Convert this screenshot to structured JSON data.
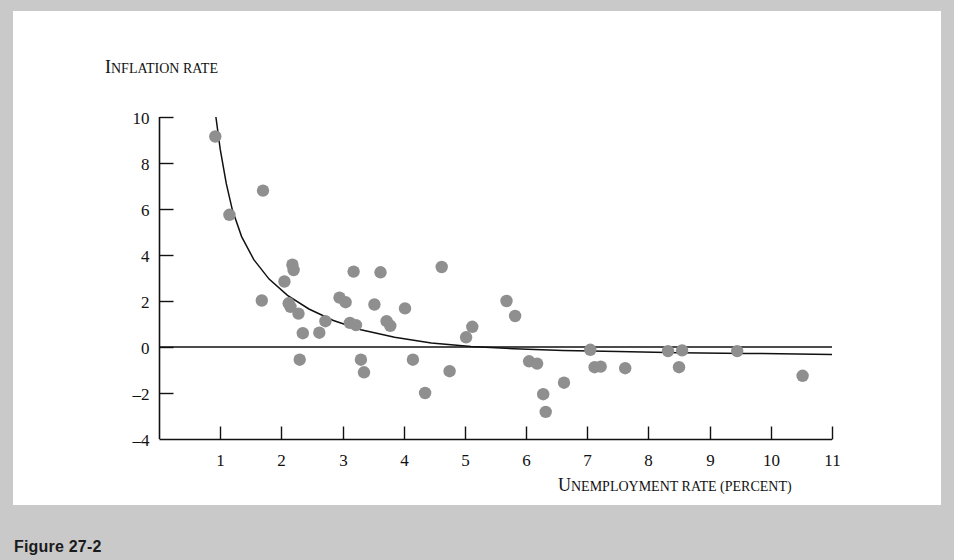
{
  "figure": {
    "caption": "Figure 27-2"
  },
  "axis": {
    "y_label": "Inflation rate",
    "x_label": "Unemployment rate (percent)",
    "y_ticks": [
      "10",
      "8",
      "6",
      "4",
      "2",
      "0",
      "-2",
      "-4"
    ],
    "x_ticks": [
      "1",
      "2",
      "3",
      "4",
      "5",
      "6",
      "7",
      "8",
      "9",
      "10",
      "11"
    ]
  },
  "colors": {
    "point": "#8f8f8f",
    "axis": "#111111",
    "panel": "#ffffff",
    "page_border": "#c9c9c9"
  },
  "chart_data": {
    "type": "scatter",
    "title": "",
    "xlabel": "Unemployment rate (percent)",
    "ylabel": "Inflation rate",
    "xlim": [
      0,
      11
    ],
    "ylim": [
      -4,
      10
    ],
    "x_ticks": [
      1,
      2,
      3,
      4,
      5,
      6,
      7,
      8,
      9,
      10,
      11
    ],
    "y_ticks": [
      10,
      8,
      6,
      4,
      2,
      0,
      -2,
      -4
    ],
    "grid": false,
    "legend": "none",
    "points": [
      [
        0.92,
        9.15
      ],
      [
        1.15,
        5.75
      ],
      [
        1.7,
        6.8
      ],
      [
        1.68,
        2.02
      ],
      [
        2.05,
        2.85
      ],
      [
        2.18,
        3.58
      ],
      [
        2.2,
        3.35
      ],
      [
        2.12,
        1.9
      ],
      [
        2.15,
        1.75
      ],
      [
        2.28,
        1.45
      ],
      [
        2.35,
        0.6
      ],
      [
        2.3,
        -0.55
      ],
      [
        2.62,
        0.62
      ],
      [
        2.72,
        1.12
      ],
      [
        2.95,
        2.15
      ],
      [
        3.05,
        1.95
      ],
      [
        3.12,
        1.05
      ],
      [
        3.18,
        3.28
      ],
      [
        3.22,
        0.95
      ],
      [
        3.3,
        -0.55
      ],
      [
        3.35,
        -1.1
      ],
      [
        3.52,
        1.85
      ],
      [
        3.62,
        3.25
      ],
      [
        3.72,
        1.12
      ],
      [
        3.78,
        0.92
      ],
      [
        4.02,
        1.68
      ],
      [
        4.15,
        -0.55
      ],
      [
        4.35,
        -2.0
      ],
      [
        4.62,
        3.48
      ],
      [
        4.75,
        -1.05
      ],
      [
        5.02,
        0.42
      ],
      [
        5.12,
        0.88
      ],
      [
        5.68,
        2.0
      ],
      [
        5.82,
        1.35
      ],
      [
        6.05,
        -0.62
      ],
      [
        6.18,
        -0.72
      ],
      [
        6.28,
        -2.05
      ],
      [
        6.32,
        -2.82
      ],
      [
        6.62,
        -1.55
      ],
      [
        7.05,
        -0.12
      ],
      [
        7.12,
        -0.88
      ],
      [
        7.22,
        -0.85
      ],
      [
        7.62,
        -0.92
      ],
      [
        8.32,
        -0.18
      ],
      [
        8.55,
        -0.15
      ],
      [
        8.5,
        -0.88
      ],
      [
        9.45,
        -0.18
      ],
      [
        10.52,
        -1.25
      ]
    ],
    "curves": [
      {
        "name": "phillips-curve",
        "description": "Downward-sloping fitted Phillips curve, hyperbolic shape",
        "points": [
          [
            0.93,
            10.0
          ],
          [
            1.0,
            8.6
          ],
          [
            1.1,
            7.1
          ],
          [
            1.2,
            5.95
          ],
          [
            1.35,
            4.8
          ],
          [
            1.55,
            3.8
          ],
          [
            1.8,
            2.95
          ],
          [
            2.1,
            2.25
          ],
          [
            2.45,
            1.65
          ],
          [
            2.85,
            1.15
          ],
          [
            3.3,
            0.75
          ],
          [
            3.85,
            0.42
          ],
          [
            4.45,
            0.18
          ],
          [
            5.1,
            0.02
          ],
          [
            5.8,
            -0.08
          ],
          [
            6.6,
            -0.15
          ],
          [
            7.5,
            -0.2
          ],
          [
            8.5,
            -0.25
          ],
          [
            9.6,
            -0.28
          ],
          [
            11.0,
            -0.32
          ]
        ]
      },
      {
        "name": "zero-line",
        "description": "Horizontal reference line at inflation rate 0",
        "points": [
          [
            0.0,
            0.0
          ],
          [
            11.0,
            0.0
          ]
        ]
      }
    ]
  }
}
